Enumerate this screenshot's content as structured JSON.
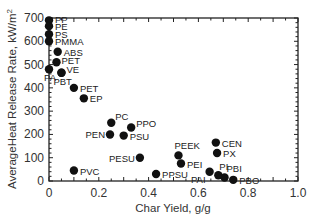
{
  "chart_data": {
    "type": "scatter",
    "title": "",
    "xlabel": "Char Yield, g/g",
    "ylabel": "AverageHeat Release Rate, kW/m²",
    "xlim": [
      0,
      1.0
    ],
    "ylim": [
      0,
      700
    ],
    "x_ticks": [
      "0",
      "0.2",
      "0.4",
      "0.6",
      "0.8",
      "1.0"
    ],
    "y_ticks": [
      "0",
      "100",
      "200",
      "300",
      "400",
      "500",
      "600",
      "700"
    ],
    "grid": false,
    "legend": "none",
    "marker_color": "#111111",
    "points": [
      {
        "label": "PP",
        "x": 0.0,
        "y": 690,
        "lx": 6,
        "ly": 3,
        "anchor": "start"
      },
      {
        "label": "PE",
        "x": 0.0,
        "y": 665,
        "lx": 6,
        "ly": 4,
        "anchor": "start"
      },
      {
        "label": "PS",
        "x": 0.0,
        "y": 630,
        "lx": 6,
        "ly": 4,
        "anchor": "start"
      },
      {
        "label": "PMMA",
        "x": 0.0,
        "y": 600,
        "lx": 6,
        "ly": 4,
        "anchor": "start"
      },
      {
        "label": "ABS",
        "x": 0.035,
        "y": 555,
        "lx": 6,
        "ly": 4,
        "anchor": "start"
      },
      {
        "label": "PET",
        "x": 0.03,
        "y": 510,
        "lx": 5,
        "ly": 2,
        "anchor": "start"
      },
      {
        "label": "PA",
        "x": 0.0,
        "y": 480,
        "lx": -5,
        "ly": 12,
        "anchor": "start"
      },
      {
        "label": "VE",
        "x": 0.05,
        "y": 465,
        "lx": 5,
        "ly": 0,
        "anchor": "start"
      },
      {
        "label": "PBT",
        "x": 0.05,
        "y": 465,
        "lx": -8,
        "ly": 12,
        "anchor": "start"
      },
      {
        "label": "PET",
        "x": 0.1,
        "y": 400,
        "lx": 6,
        "ly": 4,
        "anchor": "start"
      },
      {
        "label": "EP",
        "x": 0.14,
        "y": 355,
        "lx": 6,
        "ly": 4,
        "anchor": "start"
      },
      {
        "label": "PC",
        "x": 0.25,
        "y": 250,
        "lx": 4,
        "ly": -3,
        "anchor": "start"
      },
      {
        "label": "PPO",
        "x": 0.33,
        "y": 230,
        "lx": 5,
        "ly": 0,
        "anchor": "start"
      },
      {
        "label": "PEN",
        "x": 0.245,
        "y": 200,
        "lx": -5,
        "ly": 4,
        "anchor": "end"
      },
      {
        "label": "PSU",
        "x": 0.3,
        "y": 195,
        "lx": 6,
        "ly": 4,
        "anchor": "start"
      },
      {
        "label": "PESU",
        "x": 0.365,
        "y": 100,
        "lx": -5,
        "ly": 4,
        "anchor": "end"
      },
      {
        "label": "PVC",
        "x": 0.1,
        "y": 45,
        "lx": 6,
        "ly": 4,
        "anchor": "start"
      },
      {
        "label": "PPSU",
        "x": 0.43,
        "y": 30,
        "lx": 6,
        "ly": 4,
        "anchor": "start"
      },
      {
        "label": "PEEK",
        "x": 0.52,
        "y": 110,
        "lx": -4,
        "ly": -6,
        "anchor": "start"
      },
      {
        "label": "PEI",
        "x": 0.53,
        "y": 75,
        "lx": 6,
        "ly": 4,
        "anchor": "start"
      },
      {
        "label": "PAI",
        "x": 0.645,
        "y": 40,
        "lx": -4,
        "ly": 11,
        "anchor": "end"
      },
      {
        "label": "CEN",
        "x": 0.67,
        "y": 165,
        "lx": 6,
        "ly": 4,
        "anchor": "start"
      },
      {
        "label": "PX",
        "x": 0.675,
        "y": 120,
        "lx": 6,
        "ly": 4,
        "anchor": "start"
      },
      {
        "label": "PI",
        "x": 0.68,
        "y": 25,
        "lx": 1,
        "ly": -5,
        "anchor": "start"
      },
      {
        "label": "PBI",
        "x": 0.705,
        "y": 15,
        "lx": 2,
        "ly": -6,
        "anchor": "start"
      },
      {
        "label": "PBO",
        "x": 0.74,
        "y": 5,
        "lx": 6,
        "ly": 4,
        "anchor": "start"
      }
    ]
  }
}
